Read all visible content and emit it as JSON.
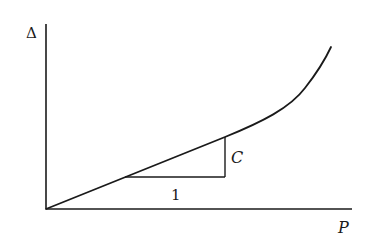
{
  "diagram": {
    "y_axis_label": "Δ",
    "x_axis_label": "P",
    "slope_run_label": "1",
    "slope_rise_label": "C",
    "colors": {
      "ink": "#1a1a1a",
      "background": "#ffffff"
    }
  }
}
